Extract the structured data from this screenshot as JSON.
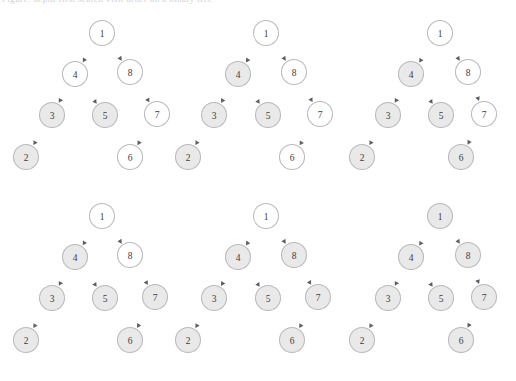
{
  "figure": {
    "caption_clipped": "Figure: depth-first search visit order on a binary tree",
    "background_color": "#ffffff",
    "node_fill_visited": "#e9e9e9",
    "node_fill_unvisited": "#ffffff",
    "node_stroke": "#b9b9bf",
    "edge_color": "#6f6f78",
    "label_color": "#3c3c44"
  },
  "layout": {
    "columns": 3,
    "rows": 2,
    "panel_width": 172,
    "panel_height": 190,
    "node_radius": 12.5
  },
  "chart_data": {
    "type": "diagram",
    "node_ids": [
      "1",
      "4",
      "8",
      "3",
      "5",
      "7",
      "2",
      "6"
    ],
    "edges": [
      {
        "from": "1",
        "to": "4"
      },
      {
        "from": "1",
        "to": "8"
      },
      {
        "from": "4",
        "to": "3"
      },
      {
        "from": "4",
        "to": "5"
      },
      {
        "from": "8",
        "to": "7"
      },
      {
        "from": "3",
        "to": "2"
      },
      {
        "from": "7",
        "to": "6"
      }
    ],
    "panels": [
      {
        "index": 1,
        "filled_nodes": [
          "3",
          "5",
          "2"
        ],
        "empty_nodes": [
          "1",
          "4",
          "8",
          "7",
          "6"
        ],
        "nodes": [
          {
            "id": "1",
            "label": "1",
            "x": 102,
            "y": 33,
            "state": "empty"
          },
          {
            "id": "4",
            "label": "4",
            "x": 75,
            "y": 74,
            "state": "empty"
          },
          {
            "id": "8",
            "label": "8",
            "x": 130,
            "y": 72,
            "state": "empty"
          },
          {
            "id": "3",
            "label": "3",
            "x": 52,
            "y": 115,
            "state": "filled"
          },
          {
            "id": "5",
            "label": "5",
            "x": 105,
            "y": 115,
            "state": "filled"
          },
          {
            "id": "7",
            "label": "7",
            "x": 157,
            "y": 114,
            "state": "empty"
          },
          {
            "id": "2",
            "label": "2",
            "x": 26,
            "y": 157,
            "state": "filled"
          },
          {
            "id": "6",
            "label": "6",
            "x": 130,
            "y": 157,
            "state": "empty"
          }
        ]
      },
      {
        "index": 2,
        "filled_nodes": [
          "4",
          "3",
          "5",
          "2"
        ],
        "empty_nodes": [
          "1",
          "8",
          "7",
          "6"
        ],
        "nodes": [
          {
            "id": "1",
            "label": "1",
            "x": 94,
            "y": 33,
            "state": "empty"
          },
          {
            "id": "4",
            "label": "4",
            "x": 66,
            "y": 74,
            "state": "filled"
          },
          {
            "id": "8",
            "label": "8",
            "x": 122,
            "y": 72,
            "state": "empty"
          },
          {
            "id": "3",
            "label": "3",
            "x": 42,
            "y": 115,
            "state": "filled"
          },
          {
            "id": "5",
            "label": "5",
            "x": 96,
            "y": 115,
            "state": "filled"
          },
          {
            "id": "7",
            "label": "7",
            "x": 148,
            "y": 114,
            "state": "empty"
          },
          {
            "id": "2",
            "label": "2",
            "x": 16,
            "y": 157,
            "state": "filled"
          },
          {
            "id": "6",
            "label": "6",
            "x": 120,
            "y": 157,
            "state": "empty"
          }
        ]
      },
      {
        "index": 3,
        "filled_nodes": [
          "4",
          "3",
          "5",
          "2",
          "6"
        ],
        "empty_nodes": [
          "1",
          "8",
          "7"
        ],
        "nodes": [
          {
            "id": "1",
            "label": "1",
            "x": 96,
            "y": 33,
            "state": "empty"
          },
          {
            "id": "4",
            "label": "4",
            "x": 67,
            "y": 74,
            "state": "filled"
          },
          {
            "id": "8",
            "label": "8",
            "x": 124,
            "y": 72,
            "state": "empty"
          },
          {
            "id": "3",
            "label": "3",
            "x": 44,
            "y": 115,
            "state": "filled"
          },
          {
            "id": "5",
            "label": "5",
            "x": 97,
            "y": 115,
            "state": "filled"
          },
          {
            "id": "7",
            "label": "7",
            "x": 140,
            "y": 114,
            "state": "empty"
          },
          {
            "id": "2",
            "label": "2",
            "x": 18,
            "y": 157,
            "state": "filled"
          },
          {
            "id": "6",
            "label": "6",
            "x": 117,
            "y": 157,
            "state": "filled"
          }
        ]
      },
      {
        "index": 4,
        "filled_nodes": [
          "4",
          "3",
          "5",
          "7",
          "2",
          "6"
        ],
        "empty_nodes": [
          "1",
          "8"
        ],
        "nodes": [
          {
            "id": "1",
            "label": "1",
            "x": 102,
            "y": 25,
            "state": "empty"
          },
          {
            "id": "4",
            "label": "4",
            "x": 75,
            "y": 66,
            "state": "filled"
          },
          {
            "id": "8",
            "label": "8",
            "x": 130,
            "y": 64,
            "state": "empty"
          },
          {
            "id": "3",
            "label": "3",
            "x": 52,
            "y": 107,
            "state": "filled"
          },
          {
            "id": "5",
            "label": "5",
            "x": 105,
            "y": 107,
            "state": "filled"
          },
          {
            "id": "7",
            "label": "7",
            "x": 155,
            "y": 106,
            "state": "filled"
          },
          {
            "id": "2",
            "label": "2",
            "x": 26,
            "y": 149,
            "state": "filled"
          },
          {
            "id": "6",
            "label": "6",
            "x": 130,
            "y": 149,
            "state": "filled"
          }
        ]
      },
      {
        "index": 5,
        "filled_nodes": [
          "4",
          "8",
          "3",
          "5",
          "7",
          "2",
          "6"
        ],
        "empty_nodes": [
          "1"
        ],
        "nodes": [
          {
            "id": "1",
            "label": "1",
            "x": 94,
            "y": 25,
            "state": "empty"
          },
          {
            "id": "4",
            "label": "4",
            "x": 66,
            "y": 66,
            "state": "filled"
          },
          {
            "id": "8",
            "label": "8",
            "x": 122,
            "y": 64,
            "state": "filled"
          },
          {
            "id": "3",
            "label": "3",
            "x": 42,
            "y": 107,
            "state": "filled"
          },
          {
            "id": "5",
            "label": "5",
            "x": 96,
            "y": 107,
            "state": "filled"
          },
          {
            "id": "7",
            "label": "7",
            "x": 146,
            "y": 106,
            "state": "filled"
          },
          {
            "id": "2",
            "label": "2",
            "x": 16,
            "y": 149,
            "state": "filled"
          },
          {
            "id": "6",
            "label": "6",
            "x": 120,
            "y": 149,
            "state": "filled"
          }
        ]
      },
      {
        "index": 6,
        "filled_nodes": [
          "1",
          "4",
          "8",
          "3",
          "5",
          "7",
          "2",
          "6"
        ],
        "empty_nodes": [],
        "nodes": [
          {
            "id": "1",
            "label": "1",
            "x": 96,
            "y": 25,
            "state": "filled"
          },
          {
            "id": "4",
            "label": "4",
            "x": 67,
            "y": 66,
            "state": "filled"
          },
          {
            "id": "8",
            "label": "8",
            "x": 124,
            "y": 64,
            "state": "filled"
          },
          {
            "id": "3",
            "label": "3",
            "x": 44,
            "y": 107,
            "state": "filled"
          },
          {
            "id": "5",
            "label": "5",
            "x": 97,
            "y": 107,
            "state": "filled"
          },
          {
            "id": "7",
            "label": "7",
            "x": 140,
            "y": 106,
            "state": "filled"
          },
          {
            "id": "2",
            "label": "2",
            "x": 18,
            "y": 149,
            "state": "filled"
          },
          {
            "id": "6",
            "label": "6",
            "x": 117,
            "y": 149,
            "state": "filled"
          }
        ]
      }
    ]
  }
}
